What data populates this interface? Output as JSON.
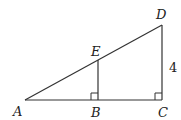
{
  "diagram": {
    "type": "geometry",
    "points": [
      {
        "id": "A",
        "label": "A"
      },
      {
        "id": "B",
        "label": "B"
      },
      {
        "id": "C",
        "label": "C"
      },
      {
        "id": "D",
        "label": "D"
      },
      {
        "id": "E",
        "label": "E"
      }
    ],
    "segments": [
      {
        "id": "AC",
        "from": "A",
        "to": "C"
      },
      {
        "id": "AD",
        "from": "A",
        "to": "D"
      },
      {
        "id": "CD",
        "from": "C",
        "to": "D",
        "length_label": "4"
      },
      {
        "id": "EB",
        "from": "E",
        "to": "B"
      }
    ],
    "right_angles": [
      "B",
      "C"
    ],
    "labels": {
      "A": "A",
      "B": "B",
      "C": "C",
      "D": "D",
      "E": "E",
      "CD_length": "4"
    }
  }
}
